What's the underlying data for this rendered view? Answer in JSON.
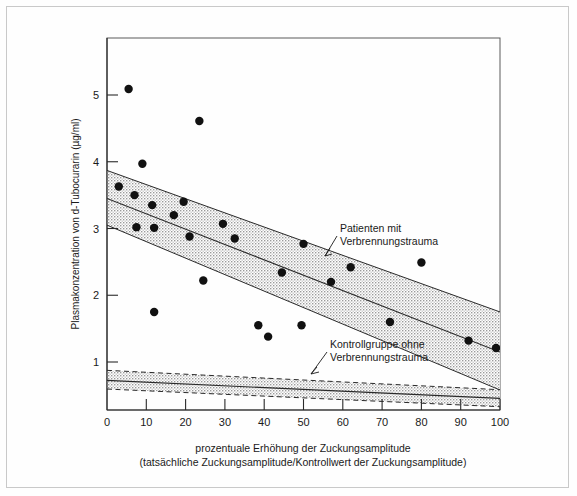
{
  "chart_data": {
    "type": "scatter",
    "title": "",
    "xlabel": "prozentuale Erhöhung der Zuckungsamplitude",
    "xlabel_line2": "(tatsächliche Zuckungsamplitude/Kontrollwert der Zuckungsamplitude)",
    "ylabel": "Plasmakonzentration von d-Tubocurarin (µg/ml)",
    "xlim": [
      0,
      100
    ],
    "ylim": [
      0,
      5.75
    ],
    "xticks": [
      0,
      10,
      20,
      30,
      40,
      50,
      60,
      70,
      80,
      90,
      100
    ],
    "xtick_labels": [
      "0",
      "10",
      "20",
      "30",
      "40",
      "50",
      "60",
      "70",
      "80",
      "90",
      "100"
    ],
    "yticks": [
      1,
      2,
      3,
      4,
      5
    ],
    "ytick_labels": [
      "1",
      "2",
      "3",
      "4",
      "5"
    ],
    "grid": false,
    "legend_position": "inline-annotation",
    "series": [
      {
        "name": "Patienten mit Verbrennungstrauma",
        "type": "scatter",
        "marker": "filled-circle",
        "color": "#111111",
        "points": [
          {
            "x": 5.5,
            "y": 5.09
          },
          {
            "x": 23.5,
            "y": 4.61
          },
          {
            "x": 9.0,
            "y": 3.97
          },
          {
            "x": 3.0,
            "y": 3.63
          },
          {
            "x": 7.0,
            "y": 3.5
          },
          {
            "x": 11.5,
            "y": 3.35
          },
          {
            "x": 17.0,
            "y": 3.2
          },
          {
            "x": 7.5,
            "y": 3.02
          },
          {
            "x": 12.0,
            "y": 3.01
          },
          {
            "x": 19.5,
            "y": 3.4
          },
          {
            "x": 29.5,
            "y": 3.07
          },
          {
            "x": 21.0,
            "y": 2.88
          },
          {
            "x": 32.5,
            "y": 2.85
          },
          {
            "x": 24.5,
            "y": 2.22
          },
          {
            "x": 12.0,
            "y": 1.75
          },
          {
            "x": 38.5,
            "y": 1.55
          },
          {
            "x": 41.0,
            "y": 1.38
          },
          {
            "x": 49.5,
            "y": 1.55
          },
          {
            "x": 44.5,
            "y": 2.34
          },
          {
            "x": 50.0,
            "y": 2.77
          },
          {
            "x": 57.0,
            "y": 2.2
          },
          {
            "x": 62.0,
            "y": 2.42
          },
          {
            "x": 72.0,
            "y": 1.6
          },
          {
            "x": 80.0,
            "y": 2.49
          },
          {
            "x": 92.0,
            "y": 1.32
          },
          {
            "x": 99.0,
            "y": 1.21
          }
        ]
      },
      {
        "name": "Patienten-Regressionsband",
        "type": "band",
        "center": [
          {
            "x": 0,
            "y": 3.45
          },
          {
            "x": 100,
            "y": 1.15
          }
        ],
        "upper": [
          {
            "x": 0,
            "y": 3.87
          },
          {
            "x": 100,
            "y": 1.75
          }
        ],
        "lower": [
          {
            "x": 0,
            "y": 3.05
          },
          {
            "x": 100,
            "y": 0.58
          }
        ],
        "fill": "stippled-grey",
        "edge_color": "#2a2a2a"
      },
      {
        "name": "Kontrollgruppe ohne Verbrennungstrauma",
        "type": "band",
        "center": [
          {
            "x": 0,
            "y": 0.725
          },
          {
            "x": 100,
            "y": 0.455
          }
        ],
        "upper": [
          {
            "x": 0,
            "y": 0.875
          },
          {
            "x": 100,
            "y": 0.585
          }
        ],
        "lower": [
          {
            "x": 0,
            "y": 0.595
          },
          {
            "x": 100,
            "y": 0.33
          }
        ],
        "fill": "stippled-grey",
        "edge_style": "dashed",
        "edge_color": "#2a2a2a"
      }
    ],
    "annotations": [
      {
        "id": "patients-annotation",
        "line1": "Patienten mit",
        "line2": "Verbrennungstrauma",
        "text_x": 340,
        "text_y": 232,
        "leader_from": [
          337,
          243
        ],
        "leader_to": [
          327,
          255
        ]
      },
      {
        "id": "control-annotation",
        "line1": "Kontrollgruppe ohne",
        "line2": "Verbrennungstrauma",
        "text_x": 330,
        "text_y": 348,
        "leader_from": [
          327,
          358
        ],
        "leader_to": [
          314,
          372
        ]
      }
    ]
  },
  "figure": {
    "background": "#ffffff",
    "border_color": "#c9c9c9",
    "axis_color": "#2a2a2a",
    "marker_color": "#111111",
    "band_fill_color": "#d9d9d9"
  }
}
